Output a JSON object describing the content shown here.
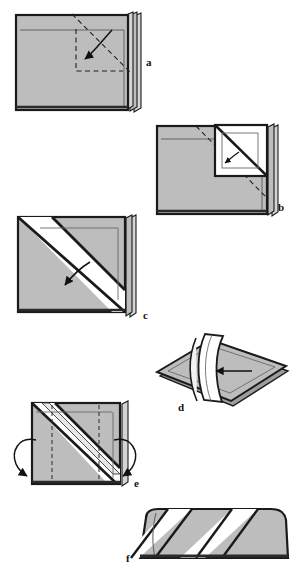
{
  "document": {
    "type": "origami-instruction-diagram",
    "title": "",
    "caption": "",
    "width": 296,
    "height": 571,
    "background_color": "#ffffff"
  },
  "palette": {
    "paper_gray": "#bdbdbd",
    "paper_gray_dark": "#a9a9a9",
    "paper_white": "#ffffff",
    "outline": "#1a1a1a",
    "crease_line": "#4a4a4a",
    "edge_shadow": "#6e6e6e",
    "label_color": "#111111"
  },
  "steps": [
    {
      "id": "a",
      "label": "a",
      "label_x": 146,
      "label_y": 66,
      "description": "Flat stack of square sheets seen face-on with a dashed square guide in the upper right and a curved arrow folding a corner inward.",
      "shape": "square-stack",
      "fill": "paper_gray",
      "has_dashed_guide": true,
      "arrow_type": "curved-fold-arrow",
      "arrow_direction": "down-left"
    },
    {
      "id": "b",
      "label": "b",
      "label_x": 278,
      "label_y": 211,
      "description": "Square sheet with the upper-right corner folded out to reveal a white triangular flap; long dashed diagonal crease runs corner to corner.",
      "shape": "square-stack",
      "fill": "paper_gray",
      "has_dashed_guide": true,
      "arrow_type": "small-curved-arrow",
      "arrow_direction": "down-left"
    },
    {
      "id": "c",
      "label": "c",
      "label_x": 143,
      "label_y": 319,
      "description": "Square with a wide white diagonal band from upper left to lower right; curved arrow points down-left across the band.",
      "shape": "square-stack",
      "fill": "paper_gray",
      "has_dashed_guide": false,
      "arrow_type": "curved-fold-arrow",
      "arrow_direction": "down-left"
    },
    {
      "id": "d",
      "label": "d",
      "label_x": 178,
      "label_y": 411,
      "description": "Rhombus seen in perspective with a vertical curved white band standing up through the middle; straight arrow points left into the band.",
      "shape": "rhombus",
      "fill": "paper_gray",
      "has_dashed_guide": false,
      "arrow_type": "straight-arrow",
      "arrow_direction": "left"
    },
    {
      "id": "e",
      "label": "e",
      "label_x": 134,
      "label_y": 487,
      "description": "Square with a diagonal white band and raised pleat; two large curved arrows wrap around the left and right edges indicating a fold behind.",
      "shape": "square-stack",
      "fill": "paper_gray",
      "has_dashed_guide": true,
      "arrow_type": "wrap-around-arrows",
      "arrow_direction": "both-sides-back"
    },
    {
      "id": "f",
      "label": "f",
      "label_x": 130,
      "label_y": 562,
      "description": "Finished wide rounded form with two white diagonal stripes across the gray body.",
      "shape": "rounded-block",
      "fill": "paper_gray",
      "has_dashed_guide": false,
      "arrow_type": "none",
      "arrow_direction": ""
    }
  ]
}
